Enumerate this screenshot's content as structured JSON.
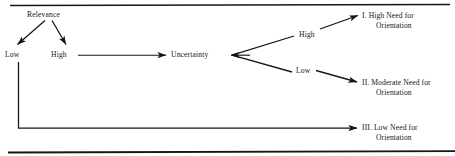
{
  "figure": {
    "type": "flow-diagram",
    "background_color": "#ffffff",
    "ink_color": "#161616",
    "rules": [
      {
        "name": "top-rule",
        "y": 5,
        "x1": 10,
        "x2": 450
      },
      {
        "name": "bottom-rule",
        "y": 152,
        "x1": 8,
        "x2": 455
      }
    ],
    "nodes": {
      "relevance": "Relevance",
      "relevance_low": "Low",
      "relevance_high": "High",
      "uncertainty": "Uncertainty",
      "uncertainty_high": "High",
      "uncertainty_low": "Low"
    },
    "outcomes": [
      {
        "id": "outcome-1",
        "line1": "I. High Need for",
        "line2": "Orientation"
      },
      {
        "id": "outcome-2",
        "line1": "II. Moderate Need for",
        "line2": "Orientation"
      },
      {
        "id": "outcome-3",
        "line1": "III. Low Need for",
        "line2": "Orientation"
      }
    ],
    "edges": [
      {
        "name": "relevance-to-low",
        "from": "relevance",
        "to": "relevance_low",
        "style": "arrow"
      },
      {
        "name": "relevance-to-high",
        "from": "relevance",
        "to": "relevance_high",
        "style": "arrow"
      },
      {
        "name": "high-to-uncertainty",
        "from": "relevance_high",
        "to": "uncertainty",
        "style": "arrow"
      },
      {
        "name": "uncertainty-fork-apex",
        "from": "uncertainty",
        "to": "fork",
        "style": "arrow"
      },
      {
        "name": "fork-to-high",
        "from": "fork",
        "to": "uncertainty_high",
        "style": "line"
      },
      {
        "name": "fork-to-low",
        "from": "fork",
        "to": "uncertainty_low",
        "style": "line"
      },
      {
        "name": "high-to-outcome-1",
        "from": "uncertainty_high",
        "to": "outcome-1",
        "style": "arrow"
      },
      {
        "name": "low-to-outcome-2",
        "from": "uncertainty_low",
        "to": "outcome-2",
        "style": "arrow"
      },
      {
        "name": "low-relevance-to-outcome-3",
        "from": "relevance_low",
        "to": "outcome-3",
        "style": "elbow-arrow"
      }
    ]
  }
}
